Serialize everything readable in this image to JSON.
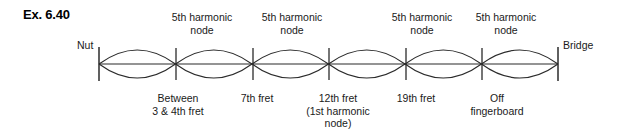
{
  "exercise": {
    "label": "Ex. 6.40"
  },
  "diagram": {
    "type": "standing-wave-string",
    "endpoints": {
      "left_label": "Nut",
      "right_label": "Bridge",
      "left_x": 99,
      "right_x": 558
    },
    "axis_y": 64,
    "loop_count": 6,
    "amplitude": 14,
    "node_x_positions": [
      176,
      253,
      329,
      406,
      482
    ],
    "stroke_color": "#2b2b2b",
    "top_labels": [
      {
        "text": "5th harmonic\nnode",
        "center_x": 202,
        "top": 11
      },
      {
        "text": "5th harmonic\nnode",
        "center_x": 292,
        "top": 11
      },
      {
        "text": "5th harmonic\nnode",
        "center_x": 422,
        "top": 11
      },
      {
        "text": "5th harmonic\nnode",
        "center_x": 506,
        "top": 11
      }
    ],
    "bottom_labels": [
      {
        "text": "Between\n3 & 4th fret",
        "center_x": 178,
        "top": 92
      },
      {
        "text": "7th fret",
        "center_x": 257,
        "top": 92
      },
      {
        "text": "12th fret\n(1st harmonic\nnode)",
        "center_x": 338,
        "top": 92
      },
      {
        "text": "19th fret",
        "center_x": 416,
        "top": 92
      },
      {
        "text": "Off\nfingerboard",
        "center_x": 497,
        "top": 92
      }
    ]
  }
}
